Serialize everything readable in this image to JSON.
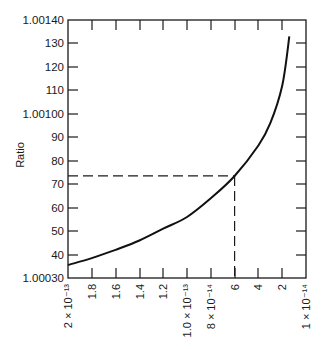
{
  "chart_data": {
    "type": "line",
    "title": "",
    "xlabel": "",
    "ylabel": "Ratio",
    "x_axis": {
      "scale": "linear, decreasing left to right",
      "unit_note": "values in units of 10^-14",
      "range": [
        20,
        0
      ],
      "tick_values": [
        20,
        18,
        16,
        14,
        12,
        10,
        8,
        6,
        4,
        2,
        0
      ],
      "tick_labels": [
        "2 × 10⁻¹³",
        "1.8",
        "1.6",
        "1.4",
        "1.2",
        "1.0 × 10⁻¹³",
        "8 × 10⁻¹⁴",
        "6",
        "4",
        "2",
        "1 × 10⁻¹⁴"
      ]
    },
    "y_axis": {
      "range": [
        1.0003,
        1.0014
      ],
      "tick_values": [
        30,
        40,
        50,
        60,
        70,
        80,
        90,
        100,
        110,
        120,
        130,
        140
      ],
      "tick_labels": [
        "1.00030",
        "40",
        "50",
        "60",
        "70",
        "80",
        "90",
        "1.00100",
        "110",
        "120",
        "130",
        "1.00140"
      ]
    },
    "grid": false,
    "legend": null,
    "series": [
      {
        "name": "Ratio",
        "x": [
          20,
          18,
          16,
          14,
          12,
          10,
          8,
          6,
          4,
          3,
          2,
          1.4
        ],
        "y": [
          1.000355,
          1.000385,
          1.00042,
          1.00046,
          1.00051,
          1.00056,
          1.00064,
          1.000735,
          1.000865,
          1.00096,
          1.00112,
          1.00133
        ]
      }
    ],
    "annotations": [
      {
        "type": "dashed-horizontal",
        "y": 1.000735,
        "from_x": 20,
        "to_x": 6
      },
      {
        "type": "dashed-vertical",
        "x": 6,
        "from_y": 1.0003,
        "to_y": 1.000735
      }
    ]
  },
  "labels": {
    "ylabel": "Ratio",
    "y_ticks": [
      {
        "label": "1.00140",
        "y": 20
      },
      {
        "label": "130",
        "y": 43
      },
      {
        "label": "120",
        "y": 67
      },
      {
        "label": "110",
        "y": 90
      },
      {
        "label": "1.00100",
        "y": 114
      },
      {
        "label": "90",
        "y": 137
      },
      {
        "label": "80",
        "y": 161
      },
      {
        "label": "70",
        "y": 184
      },
      {
        "label": "60",
        "y": 208
      },
      {
        "label": "50",
        "y": 231
      },
      {
        "label": "40",
        "y": 255
      },
      {
        "label": "1.00030",
        "y": 278
      }
    ],
    "x_ticks": [
      {
        "label": "2 × 10⁻¹³",
        "x": 68
      },
      {
        "label": "1.8",
        "x": 92
      },
      {
        "label": "1.6",
        "x": 116
      },
      {
        "label": "1.4",
        "x": 140
      },
      {
        "label": "1.2",
        "x": 163
      },
      {
        "label": "1.0 × 10⁻¹³",
        "x": 187
      },
      {
        "label": "8 × 10⁻¹⁴",
        "x": 211
      },
      {
        "label": "6",
        "x": 235
      },
      {
        "label": "4",
        "x": 258
      },
      {
        "label": "2",
        "x": 282
      },
      {
        "label": "1 × 10⁻¹⁴",
        "x": 306
      }
    ]
  }
}
